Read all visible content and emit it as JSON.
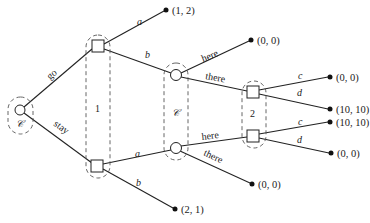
{
  "diagram": {
    "type": "extensive-form game tree",
    "root": {
      "label": "𝒞",
      "kind": "chance"
    },
    "root_edges": {
      "go": "go",
      "stay": "stay"
    },
    "info_set_1": {
      "label": "1",
      "kind": "player"
    },
    "player1_top_edges": {
      "a": "a",
      "b": "b"
    },
    "player1_bottom_edges": {
      "a": "a",
      "b": "b"
    },
    "chance_set": {
      "label": "𝒞",
      "kind": "chance"
    },
    "chance_top_edges": {
      "here": "here",
      "there": "there"
    },
    "chance_bottom_edges": {
      "here": "here",
      "there": "there"
    },
    "info_set_2": {
      "label": "2",
      "kind": "player"
    },
    "player2_top_edges": {
      "c": "c",
      "d": "d"
    },
    "player2_bottom_edges": {
      "c": "c",
      "d": "d"
    },
    "payoffs": {
      "top_a": "(1, 2)",
      "top_b_here": "(0, 0)",
      "top_c": "(0, 0)",
      "top_d": "(10, 10)",
      "bottom_c": "(10, 10)",
      "bottom_d": "(0, 0)",
      "bottom_there": "(0, 0)",
      "bottom_b": "(2, 1)"
    }
  }
}
